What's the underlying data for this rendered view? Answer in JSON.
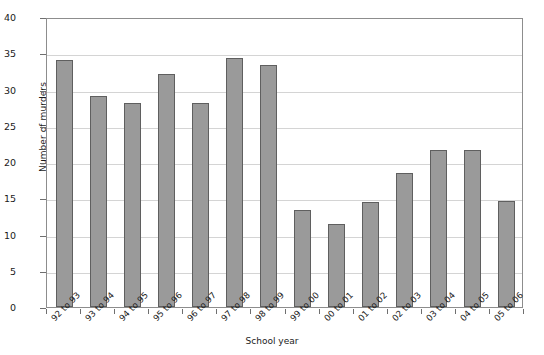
{
  "chart_data": {
    "type": "bar",
    "title": "",
    "xlabel": "School year",
    "ylabel": "Number of murders",
    "categories": [
      "92 to 93",
      "93 to 94",
      "94 to 95",
      "95 to 96",
      "96 to 97",
      "97 to 98",
      "98 to 99",
      "99 to 00",
      "00 to 01",
      "01 to 02",
      "02 to 03",
      "03 to 04",
      "04 to 05",
      "05 to 06"
    ],
    "values": [
      34.1,
      29.1,
      28.1,
      32.2,
      28.2,
      34.4,
      33.4,
      13.4,
      11.5,
      14.5,
      18.5,
      21.6,
      21.6,
      14.6
    ],
    "ylim": [
      0,
      40
    ],
    "yticks": [
      0,
      5,
      10,
      15,
      20,
      25,
      30,
      35,
      40
    ],
    "ytick_labels": [
      "0",
      "5",
      "10",
      "15",
      "20",
      "25",
      "30",
      "35",
      "40"
    ],
    "grid": "horizontal",
    "legend": "none",
    "bar_color": "#9a9a9a",
    "bar_edge_color": "#5f5f5f",
    "grid_color": "#d4d4d4",
    "axis_color": "#8d8d8d"
  }
}
